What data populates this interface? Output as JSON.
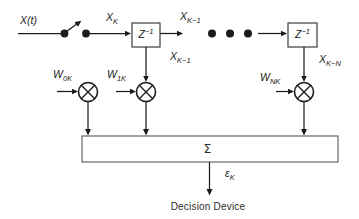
{
  "colors": {
    "ink": "#1b1b1b",
    "background": "#ffffff"
  },
  "diagram": {
    "kind": "tapped-delay-line adaptive filter",
    "labels": {
      "input": "X(t)",
      "sample": {
        "base": "X",
        "sub": "K"
      },
      "tap1_top": {
        "base": "X",
        "sub": "K−1"
      },
      "tap1": {
        "base": "X",
        "sub": "K−1"
      },
      "tapN": {
        "base": "X",
        "sub": "K−N"
      },
      "delay1": {
        "base": "Z",
        "sup": "−1"
      },
      "delay2": {
        "base": "Z",
        "sup": "−1"
      },
      "weight0": {
        "base": "W",
        "sub": "0K"
      },
      "weight1": {
        "base": "W",
        "sub": "1K"
      },
      "weightN": {
        "base": "W",
        "sub": "NK"
      },
      "summer": "Σ",
      "error": {
        "base": "ε",
        "sub": "K"
      },
      "decision": "Decision Device"
    }
  }
}
